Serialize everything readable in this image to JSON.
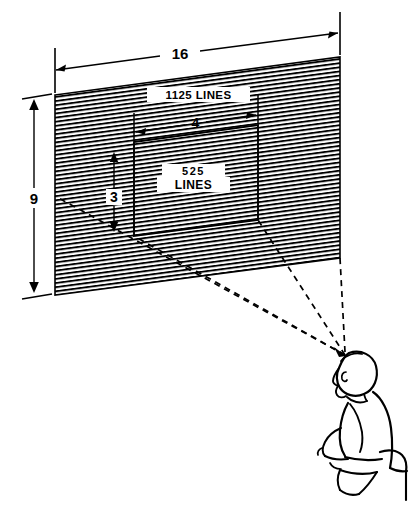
{
  "figure": {
    "type": "technical-line-drawing",
    "background_color": "#ffffff",
    "line_color": "#000000"
  },
  "screen": {
    "name": "wide-screen-1125-lines",
    "label": "1125  LINES",
    "aspect_width_label": "16",
    "aspect_height_label": "9",
    "fill": "scanline-hatch"
  },
  "inner_screen": {
    "name": "standard-screen-525-lines",
    "label_line1": "525",
    "label_line2": "LINES",
    "aspect_width_label": "4",
    "aspect_height_label": "3"
  },
  "dimensions": [
    {
      "name": "overall-width",
      "value": "16",
      "orientation": "horizontal"
    },
    {
      "name": "overall-height",
      "value": "9",
      "orientation": "vertical"
    },
    {
      "name": "inner-width",
      "value": "4",
      "orientation": "horizontal"
    },
    {
      "name": "inner-height",
      "value": "3",
      "orientation": "vertical"
    }
  ],
  "viewer": {
    "name": "seated-viewer",
    "description": "person seated on chair in side view facing the screen",
    "sight_lines": 4,
    "sight_line_style": "dashed"
  },
  "colors": {
    "stroke": "#000000",
    "background": "#ffffff"
  }
}
